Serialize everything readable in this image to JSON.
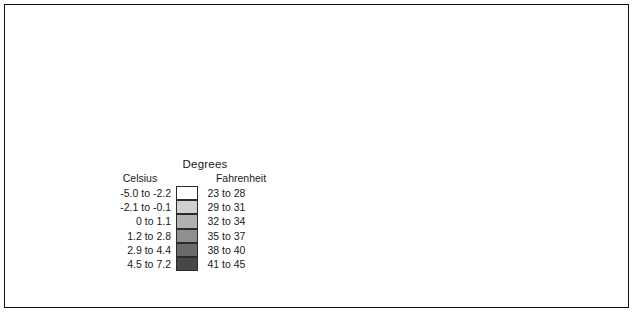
{
  "map": {
    "region_name": "North Carolina",
    "map_type": "choropleth-temperature-with-hillshade",
    "background_color": "#ffffff",
    "border_color": "#111111",
    "county_line_color": "#2a2a2a",
    "water_color": "#ffffff",
    "notes_visible": ""
  },
  "legend": {
    "title": "Degrees",
    "column_celsius": "Celsius",
    "column_fahrenheit": "Fahrenheit",
    "rows": [
      {
        "celsius": "-5.0 to -2.2",
        "fahrenheit": "23 to 28",
        "color": "#ffffff"
      },
      {
        "celsius": "-2.1 to -0.1",
        "fahrenheit": "29 to 31",
        "color": "#d0d0d0"
      },
      {
        "celsius": "0 to 1.1",
        "fahrenheit": "32 to 34",
        "color": "#b0b0b0"
      },
      {
        "celsius": "1.2 to 2.8",
        "fahrenheit": "35 to 37",
        "color": "#8f8f8f"
      },
      {
        "celsius": "2.9 to 4.4",
        "fahrenheit": "38 to 40",
        "color": "#6b6b6b"
      },
      {
        "celsius": "4.5 to 7.2",
        "fahrenheit": "41 to 45",
        "color": "#474747"
      }
    ]
  },
  "chart_data": {
    "type": "heatmap",
    "title": "Degrees",
    "categories": [
      "-5.0 to -2.2",
      "-2.1 to -0.1",
      "0 to 1.1",
      "1.2 to 2.8",
      "2.9 to 4.4",
      "4.5 to 7.2"
    ],
    "categories_fahrenheit": [
      "23 to 28",
      "29 to 31",
      "32 to 34",
      "35 to 37",
      "38 to 40",
      "41 to 45"
    ],
    "colors": [
      "#ffffff",
      "#d0d0d0",
      "#b0b0b0",
      "#8f8f8f",
      "#6b6b6b",
      "#474747"
    ],
    "xlabel": "Celsius",
    "ylabel": "Fahrenheit",
    "legend_position": "center-left",
    "grid": false
  }
}
